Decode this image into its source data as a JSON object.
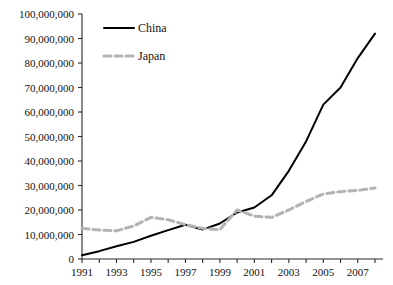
{
  "chart_data": {
    "type": "line",
    "title": "",
    "subtitle": "",
    "xlabel": "",
    "ylabel": "",
    "grid": false,
    "legend_position": "top-center",
    "x": [
      1991,
      1992,
      1993,
      1994,
      1995,
      1996,
      1997,
      1998,
      1999,
      2000,
      2001,
      2002,
      2003,
      2004,
      2005,
      2006,
      2007,
      2008
    ],
    "xlim": [
      1991,
      2008
    ],
    "ylim": [
      0,
      100000000
    ],
    "ytick_values": [
      0,
      10000000,
      20000000,
      30000000,
      40000000,
      50000000,
      60000000,
      70000000,
      80000000,
      90000000,
      100000000
    ],
    "ytick_labels": [
      "0",
      "10,000,000",
      "20,000,000",
      "30,000,000",
      "40,000,000",
      "50,000,000",
      "60,000,000",
      "70,000,000",
      "80,000,000",
      "90,000,000",
      "100,000,000"
    ],
    "xtick_values": [
      1991,
      1992,
      1993,
      1994,
      1995,
      1996,
      1997,
      1998,
      1999,
      2000,
      2001,
      2002,
      2003,
      2004,
      2005,
      2006,
      2007,
      2008
    ],
    "xtick_labels": [
      "1991",
      "",
      "1993",
      "",
      "1995",
      "",
      "1997",
      "",
      "1999",
      "",
      "2001",
      "",
      "2003",
      "",
      "2005",
      "",
      "2007",
      ""
    ],
    "series": [
      {
        "name": "China",
        "color": "#000000",
        "style": "solid",
        "width": 2.0,
        "values": [
          1500000,
          3200000,
          5200000,
          7000000,
          9500000,
          11800000,
          14000000,
          12000000,
          14500000,
          19000000,
          21000000,
          26000000,
          36000000,
          48000000,
          63000000,
          70000000,
          82000000,
          92000000
        ]
      },
      {
        "name": "Japan",
        "color": "#b3b3b3",
        "style": "dashed",
        "width": 3.0,
        "values": [
          12500000,
          11800000,
          11500000,
          13500000,
          17000000,
          16000000,
          14000000,
          12500000,
          12000000,
          20000000,
          17500000,
          17000000,
          20000000,
          23500000,
          26500000,
          27500000,
          28000000,
          29000000
        ]
      }
    ]
  },
  "legend": {
    "entries": [
      {
        "label": "China"
      },
      {
        "label": "Japan"
      }
    ]
  }
}
